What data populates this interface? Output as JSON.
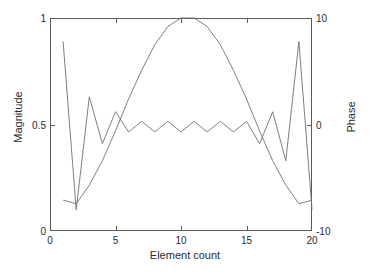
{
  "chart_data": {
    "type": "line",
    "title": "",
    "xlabel": "Element count",
    "ylabel": "Magnitude",
    "ylabel_right": "Phase",
    "xlim": [
      0,
      20
    ],
    "ylim": [
      0,
      1
    ],
    "ylim_right": [
      -10,
      10
    ],
    "xticks": [
      "0",
      "5",
      "10",
      "15",
      "20"
    ],
    "xtick_values": [
      0,
      5,
      10,
      15,
      20
    ],
    "yticks": [
      "0",
      "0.5",
      "1"
    ],
    "ytick_values": [
      0,
      0.5,
      1
    ],
    "yticks_right": [
      "-10",
      "0",
      "10"
    ],
    "ytick_values_right": [
      -10,
      0,
      10
    ],
    "grid": false,
    "legend": "none",
    "line_color": "#707070",
    "axis_color": "#5a5a5a",
    "background": "#ffffff",
    "x": [
      1,
      2,
      3,
      4,
      5,
      6,
      7,
      8,
      9,
      10,
      11,
      12,
      13,
      14,
      15,
      16,
      17,
      18,
      19,
      20
    ],
    "series": [
      {
        "name": "Magnitude",
        "axis": "left",
        "units": "magnitude",
        "values": [
          0.145,
          0.128,
          0.215,
          0.33,
          0.47,
          0.62,
          0.755,
          0.875,
          0.96,
          1.0,
          1.0,
          0.96,
          0.875,
          0.755,
          0.62,
          0.47,
          0.33,
          0.215,
          0.128,
          0.145
        ]
      },
      {
        "name": "Phase",
        "axis": "right",
        "units": "phase",
        "values": [
          7.8,
          -8.0,
          2.6,
          -1.8,
          1.2,
          -0.7,
          0.3,
          -0.7,
          0.3,
          -0.7,
          0.3,
          -0.7,
          0.3,
          -0.7,
          0.3,
          -1.8,
          1.2,
          -3.4,
          7.8,
          -8.0
        ]
      }
    ]
  },
  "axes": {
    "x_title": "Element count",
    "y_title_left": "Magnitude",
    "y_title_right": "Phase"
  }
}
